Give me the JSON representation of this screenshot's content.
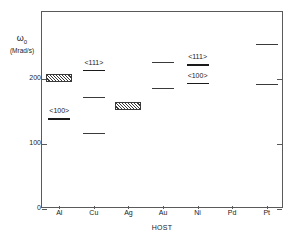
{
  "chart_data": {
    "type": "scatter",
    "title_isotope": "111",
    "title_rest": "Cd ( He )",
    "ylabel_symbol": "ω",
    "ylabel_subscript": "0",
    "ylabel_unit": "(Mrad/s)",
    "xlabel": "HOST",
    "categories": [
      "Al",
      "Cu",
      "Ag",
      "Au",
      "Ni",
      "Pd",
      "Pt"
    ],
    "ylim": [
      0,
      260
    ],
    "yticks": [
      0,
      100,
      200
    ],
    "ytick_labels": [
      "0",
      "100",
      "200"
    ],
    "grid": false,
    "legend": "none",
    "annotations": [
      "<111>",
      "<100>"
    ],
    "series": [
      {
        "name": "Al",
        "host": "Al",
        "markers": [
          {
            "kind": "box",
            "label": "",
            "value": 201,
            "low": 195,
            "high": 207
          },
          {
            "kind": "line",
            "label": "<100>",
            "value": 140,
            "emphasis": "thick"
          }
        ]
      },
      {
        "name": "Cu",
        "host": "Cu",
        "markers": [
          {
            "kind": "line",
            "label": "<111>",
            "value": 214,
            "emphasis": "thick"
          },
          {
            "kind": "line",
            "label": "",
            "value": 172,
            "emphasis": "thin"
          },
          {
            "kind": "line",
            "label": "",
            "value": 117,
            "emphasis": "thin"
          }
        ]
      },
      {
        "name": "Ag",
        "host": "Ag",
        "markers": [
          {
            "kind": "box",
            "label": "",
            "value": 158,
            "low": 152,
            "high": 165
          }
        ]
      },
      {
        "name": "Au",
        "host": "Au",
        "markers": [
          {
            "kind": "line",
            "label": "",
            "value": 226,
            "emphasis": "thin"
          },
          {
            "kind": "line",
            "label": "",
            "value": 186,
            "emphasis": "thin"
          }
        ]
      },
      {
        "name": "Ni",
        "host": "Ni",
        "markers": [
          {
            "kind": "line",
            "label": "<111>",
            "value": 223,
            "emphasis": "thick"
          },
          {
            "kind": "line",
            "label": "<100>",
            "value": 194,
            "emphasis": "thick"
          }
        ]
      },
      {
        "name": "Pd",
        "host": "Pd",
        "markers": []
      },
      {
        "name": "Pt",
        "host": "Pt",
        "markers": [
          {
            "kind": "line",
            "label": "",
            "value": 254,
            "emphasis": "thin"
          },
          {
            "kind": "line",
            "label": "",
            "value": 192,
            "emphasis": "thin"
          }
        ]
      }
    ]
  },
  "colors": {
    "axis": "#5a5a5a",
    "marker": "#3a3a3a",
    "marker_emphasis": "#1a1a1a",
    "background": "#ffffff",
    "text": "#1a1a1a"
  }
}
